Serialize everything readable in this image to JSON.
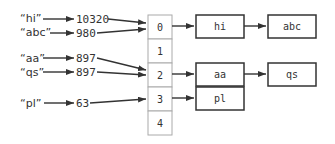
{
  "keys": [
    {
      "label": "“hi”",
      "hash": "10320"
    },
    {
      "label": "“abc”",
      "hash": "980"
    },
    {
      "label": "“aa”",
      "hash": "897"
    },
    {
      "label": "“qs”",
      "hash": "897"
    },
    {
      "label": "“pl”",
      "hash": "63"
    }
  ],
  "table": {
    "indices": [
      "0",
      "1",
      "2",
      "3",
      "4"
    ]
  },
  "chains": {
    "row0": [
      "hi",
      "abc"
    ],
    "row2": [
      "aa",
      "qs"
    ],
    "row3": [
      "pl"
    ]
  }
}
